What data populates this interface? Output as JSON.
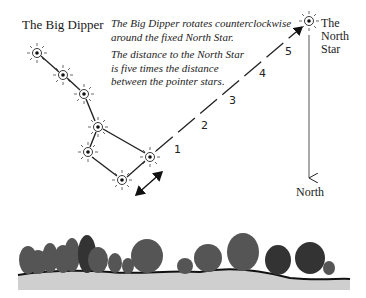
{
  "diagram": {
    "title": "The Big Dipper",
    "caption": {
      "line1": "The Big Dipper rotates counterclockwise",
      "line2": "around the fixed North Star.",
      "line3": "The distance to the North Star",
      "line4": "is five times the distance",
      "line5": "between the pointer stars."
    },
    "north_star_label": [
      "The",
      "North",
      "Star"
    ],
    "north_label": "North",
    "distance_markers": [
      "1",
      "2",
      "3",
      "4",
      "5"
    ],
    "colors": {
      "ink": "#1a1a1a",
      "ground": "#bdbdbd",
      "background": "#ffffff"
    }
  }
}
